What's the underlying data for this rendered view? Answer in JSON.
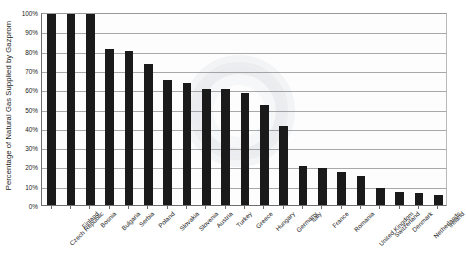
{
  "chart_data": {
    "type": "bar",
    "title": "",
    "xlabel": "",
    "ylabel": "Percentage of Natural Gas Supplied by Gazprom",
    "ylim": [
      0,
      100
    ],
    "grid": true,
    "legend": false,
    "y_ticks": [
      "0%",
      "10%",
      "20%",
      "30%",
      "40%",
      "50%",
      "60%",
      "70%",
      "80%",
      "90%",
      "100%"
    ],
    "bar_color": "#1a1a1a",
    "categories": [
      "Czech Republic",
      "Finland",
      "Bosnia",
      "Bulgaria",
      "Serbia",
      "Poland",
      "Slovakia",
      "Slovenia",
      "Austria",
      "Turkey",
      "Greece",
      "Hungary",
      "Germany",
      "Italy",
      "France",
      "Romania",
      "United Kingdom",
      "Switzerland",
      "Denmark",
      "Netherlands",
      "Ireland"
    ],
    "values": [
      100,
      100,
      100,
      81,
      80,
      73,
      65,
      63,
      60,
      60,
      58,
      52,
      41,
      20,
      19,
      17,
      15,
      9,
      7,
      6,
      5
    ]
  }
}
